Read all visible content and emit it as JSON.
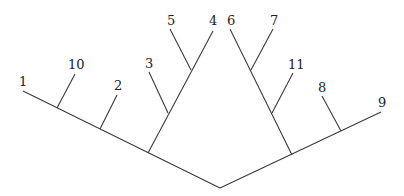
{
  "diagram": {
    "type": "cladogram",
    "leaves": [
      {
        "id": "1",
        "label": "1"
      },
      {
        "id": "10",
        "label": "10"
      },
      {
        "id": "2",
        "label": "2"
      },
      {
        "id": "3",
        "label": "3"
      },
      {
        "id": "5",
        "label": "5"
      },
      {
        "id": "4",
        "label": "4"
      },
      {
        "id": "6",
        "label": "6"
      },
      {
        "id": "7",
        "label": "7"
      },
      {
        "id": "11",
        "label": "11"
      },
      {
        "id": "8",
        "label": "8"
      },
      {
        "id": "9",
        "label": "9"
      }
    ],
    "structure": "((1,10,2,(3,(5,4))),((6,7),11),8,9)"
  }
}
